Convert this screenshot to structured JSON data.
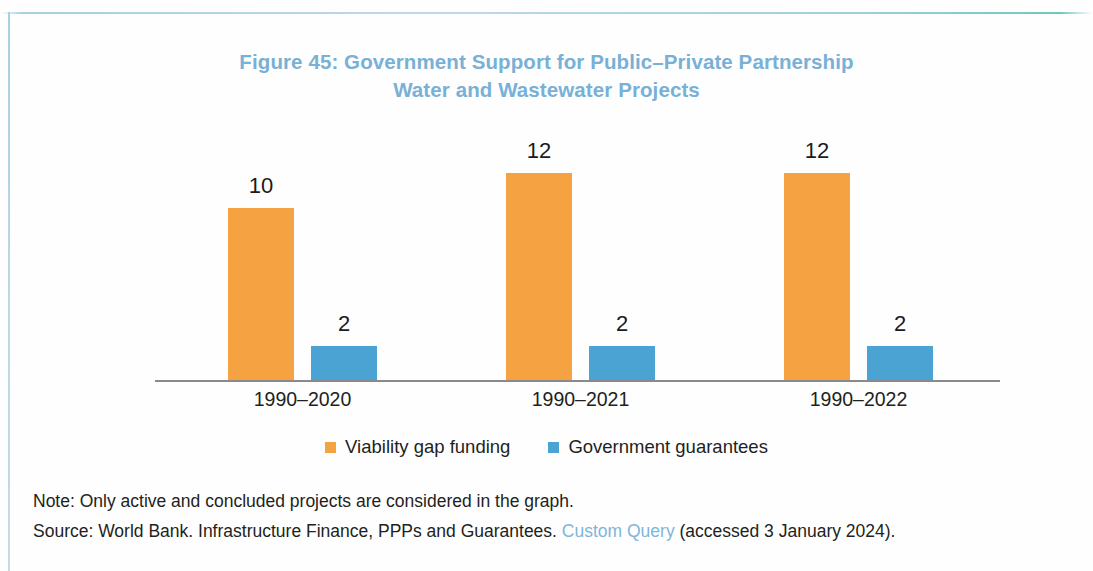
{
  "figure": {
    "title_line_1": "Figure 45: Government Support for Public–Private Partnership",
    "title_line_2": "Water and Wastewater Projects",
    "title_color": "#79b0d6"
  },
  "notes": {
    "note": "Note: Only active and concluded projects are considered in the graph.",
    "source_prefix": "Source: World Bank. Infrastructure Finance, PPPs and Guarantees. ",
    "source_link": "Custom Query",
    "source_suffix": " (accessed 3 January 2024).",
    "link_color": "#7fb5dc"
  },
  "chart_data": {
    "type": "bar",
    "title": "Figure 45: Government Support for Public–Private Partnership Water and Wastewater Projects",
    "xlabel": "",
    "ylabel": "",
    "ylim": [
      0,
      14
    ],
    "grid": false,
    "legend_position": "bottom",
    "data_labels": true,
    "categories": [
      "1990–2020",
      "1990–2021",
      "1990–2022"
    ],
    "series": [
      {
        "name": "Viability gap funding",
        "color": "#f5a243",
        "values": [
          10,
          12,
          12
        ]
      },
      {
        "name": "Government guarantees",
        "color": "#4ba3d4",
        "values": [
          2,
          2,
          2
        ]
      }
    ]
  }
}
